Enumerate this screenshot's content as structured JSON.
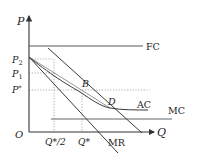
{
  "diagram": {
    "axes": {
      "y_label": "P",
      "x_label": "Q",
      "origin_label": "O"
    },
    "y_ticks": [
      {
        "label_main": "P",
        "label_sub": "2",
        "y": 59
      },
      {
        "label_main": "P",
        "label_sub": "1",
        "y": 73
      },
      {
        "label_main": "P",
        "label_sub": "*",
        "y": 90
      }
    ],
    "x_ticks": [
      {
        "label": "Q*/2",
        "x": 54
      },
      {
        "label": "Q*",
        "x": 82
      }
    ],
    "curves": {
      "fc": "FC",
      "ac": "AC",
      "mc": "MC",
      "mr": "MR"
    },
    "points": {
      "b": "B",
      "d": "D"
    },
    "colors": {
      "axis": "#333333",
      "line": "#3a3a3a",
      "light_line": "#8a8a8a",
      "dotted": "#9a9a9a"
    }
  }
}
